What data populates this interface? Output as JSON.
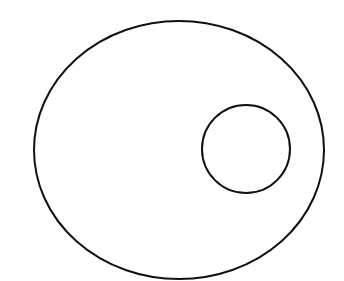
{
  "canvas": {
    "width": 344,
    "height": 281,
    "background_color": "#ffffff",
    "title": "Geometric figure: small circle inside a large ellipse"
  },
  "style": {
    "stroke_color": "#111111",
    "fill": "none",
    "outer_stroke_width": 2,
    "inner_stroke_width": 2
  },
  "shapes": [
    {
      "id": "outer-ellipse",
      "type": "ellipse",
      "name": "outer-ellipse",
      "cx": 179,
      "cy": 150,
      "rx": 145,
      "ry": 129,
      "bounds": {
        "left": 34,
        "right": 324,
        "top": 21,
        "bottom": 279
      },
      "stroke_color": "#111111",
      "stroke_width": 2,
      "fill": "none"
    },
    {
      "id": "inner-circle",
      "type": "circle",
      "name": "inner-circle",
      "cx": 246,
      "cy": 149,
      "r": 44,
      "bounds": {
        "left": 202,
        "right": 290,
        "top": 105,
        "bottom": 193
      },
      "stroke_color": "#111111",
      "stroke_width": 2,
      "fill": "none"
    }
  ],
  "labels": []
}
